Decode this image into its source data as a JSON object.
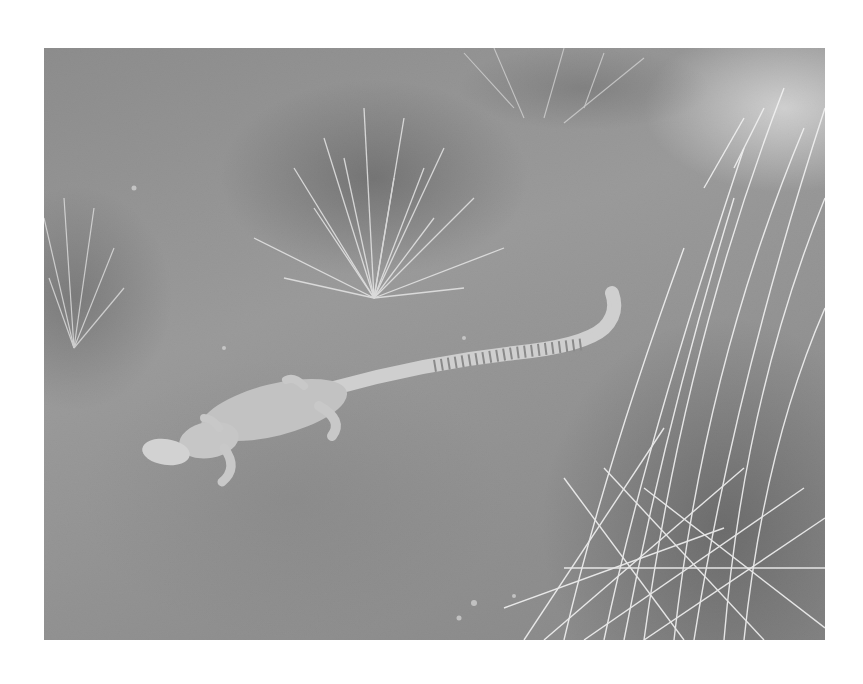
{
  "photo": {
    "subject": "monitor lizard on sandy ground among grass tufts",
    "tone": "grayscale",
    "frame": {
      "x": 44,
      "y": 48,
      "width": 781,
      "height": 592
    }
  },
  "colors": {
    "page_background": "#ffffff",
    "ground": "#8f8f8f",
    "grass_highlight": "#f0f0f0",
    "lizard_body": "#c9c9c9"
  }
}
